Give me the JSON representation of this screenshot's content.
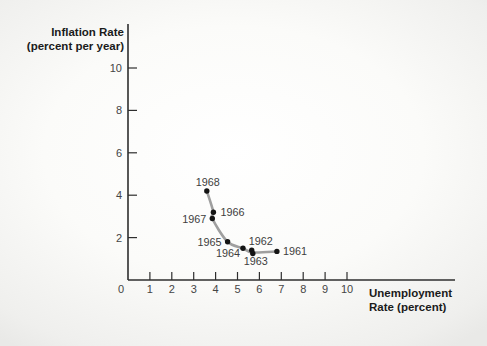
{
  "figure": {
    "y_axis_title": [
      "Inflation Rate",
      "(percent per year)"
    ],
    "x_axis_title": [
      "Unemployment",
      "Rate (percent)"
    ]
  },
  "chart_data": {
    "type": "scatter",
    "xlabel": "Unemployment Rate (percent)",
    "ylabel": "Inflation Rate (percent per year)",
    "xlim": [
      0,
      10
    ],
    "ylim": [
      0,
      10
    ],
    "x_ticks": [
      0,
      1,
      2,
      3,
      4,
      5,
      6,
      7,
      8,
      9,
      10
    ],
    "y_ticks": [
      2,
      4,
      6,
      8,
      10
    ],
    "grid": false,
    "legend": "none",
    "series": [
      {
        "name": "annual-observations",
        "points": [
          {
            "year": "1961",
            "x": 6.8,
            "y": 1.35,
            "label_anchor": "start",
            "label_dx": 6,
            "label_dy": 4
          },
          {
            "year": "1962",
            "x": 5.65,
            "y": 1.4,
            "label_anchor": "middle",
            "label_dx": 9,
            "label_dy": -5
          },
          {
            "year": "1963",
            "x": 5.7,
            "y": 1.25,
            "label_anchor": "middle",
            "label_dx": 3,
            "label_dy": 11
          },
          {
            "year": "1964",
            "x": 5.25,
            "y": 1.5,
            "label_anchor": "middle",
            "label_dx": -15,
            "label_dy": 9
          },
          {
            "year": "1965",
            "x": 4.55,
            "y": 1.8,
            "label_anchor": "end",
            "label_dx": -6,
            "label_dy": 4
          },
          {
            "year": "1966",
            "x": 3.9,
            "y": 3.2,
            "label_anchor": "start",
            "label_dx": 7,
            "label_dy": 4
          },
          {
            "year": "1967",
            "x": 3.85,
            "y": 2.9,
            "label_anchor": "end",
            "label_dx": -6,
            "label_dy": 4
          },
          {
            "year": "1968",
            "x": 3.6,
            "y": 4.2,
            "label_anchor": "middle",
            "label_dx": 1,
            "label_dy": -5
          }
        ]
      }
    ],
    "curve_through": [
      [
        3.6,
        4.2
      ],
      [
        3.9,
        3.2
      ],
      [
        3.85,
        2.9
      ],
      [
        4.55,
        1.8
      ],
      [
        5.25,
        1.5
      ],
      [
        5.68,
        1.3
      ],
      [
        6.8,
        1.35
      ]
    ],
    "colors": {
      "curve": "#9f9f9f",
      "point": "#141414",
      "axis": "#2e2e2e",
      "tick_text": "#454545",
      "year_text": "#3e3e3e",
      "title_text": "#1b1b1b"
    }
  }
}
